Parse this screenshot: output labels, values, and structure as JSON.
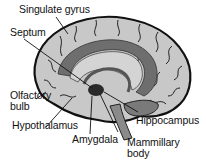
{
  "diagram": {
    "labels": [
      {
        "id": "cingulate",
        "text": "Singulate gyrus"
      },
      {
        "id": "septum",
        "text": "Septum"
      },
      {
        "id": "olfactory",
        "text": "Olfactory\nbulb"
      },
      {
        "id": "hypothalamus",
        "text": "Hypothalamus"
      },
      {
        "id": "amygdala",
        "text": "Amygdala"
      },
      {
        "id": "mammillary",
        "text": "Mammillary\nbody"
      },
      {
        "id": "hippocampus",
        "text": "Hippocampus"
      }
    ],
    "colors": {
      "brain_fill": "#c8c8c8",
      "limbic_fill": "#6e6e6e",
      "outline": "#111111",
      "background": "#ffffff"
    }
  }
}
